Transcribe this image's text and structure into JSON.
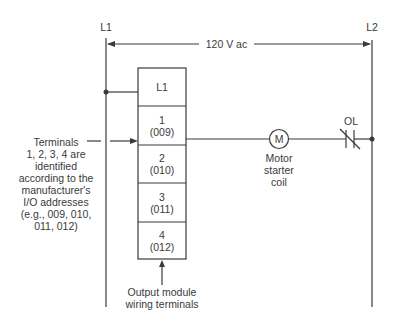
{
  "rails": {
    "left_label": "L1",
    "right_label": "L2",
    "voltage_label": "120 V ac"
  },
  "module": {
    "cells": [
      {
        "terminal": "L1",
        "address": ""
      },
      {
        "terminal": "1",
        "address": "(009)"
      },
      {
        "terminal": "2",
        "address": "(010)"
      },
      {
        "terminal": "3",
        "address": "(011)"
      },
      {
        "terminal": "4",
        "address": "(012)"
      }
    ],
    "caption_line1": "Output module",
    "caption_line2": "wiring terminals"
  },
  "annotation": {
    "lines": [
      "Terminals",
      "1, 2, 3, 4 are",
      "identified",
      "according to the",
      "manufacturer's",
      "I/O addresses",
      "(e.g., 009, 010,",
      "011, 012)"
    ]
  },
  "coil": {
    "symbol": "M",
    "label_lines": [
      "Motor",
      "starter",
      "coil"
    ]
  },
  "overload": {
    "label": "OL"
  },
  "colors": {
    "line": "#3a3a3a",
    "background": "#ffffff"
  }
}
